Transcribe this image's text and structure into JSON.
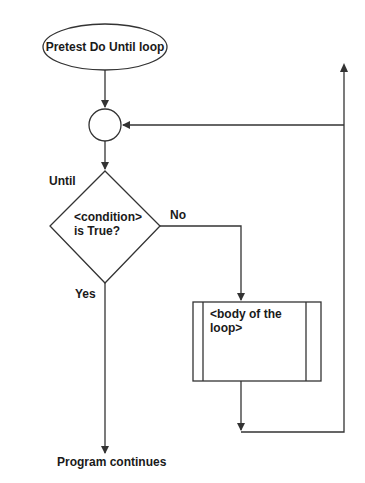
{
  "diagram": {
    "title": "Pretest Do Until loop",
    "nodes": {
      "start": {
        "label": "Pretest Do Until loop",
        "shape": "ellipse"
      },
      "connector": {
        "label": "",
        "shape": "circle"
      },
      "decision": {
        "line1": "<condition>",
        "line2": "is True?",
        "shape": "diamond",
        "side_label": "Until"
      },
      "body": {
        "line1": "<body of the",
        "line2": "loop>",
        "shape": "predefined-process"
      },
      "end": {
        "label": "Program continues"
      }
    },
    "edges": {
      "yes_label": "Yes",
      "no_label": "No"
    }
  }
}
